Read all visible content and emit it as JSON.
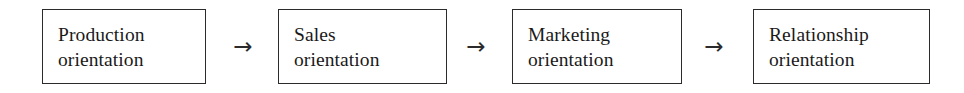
{
  "diagram": {
    "background_color": "#ffffff",
    "border_color": "#2b2b2b",
    "text_color": "#1a1a1a",
    "arrow_glyph": "→",
    "stages": [
      {
        "id": "production-orientation",
        "line1": "Production",
        "line2": "orientation",
        "x": 42,
        "y": 9,
        "width": 164,
        "height": 75
      },
      {
        "id": "sales-orientation",
        "line1": "Sales",
        "line2": "orientation",
        "x": 278,
        "y": 9,
        "width": 169,
        "height": 75
      },
      {
        "id": "marketing-orientation",
        "line1": "Marketing",
        "line2": "orientation",
        "x": 512,
        "y": 9,
        "width": 170,
        "height": 75
      },
      {
        "id": "relationship-orientation",
        "line1": "Relationship",
        "line2": "orientation",
        "x": 753,
        "y": 9,
        "width": 177,
        "height": 75
      }
    ],
    "arrows": [
      {
        "id": "arrow-production-to-sales",
        "label": "→",
        "x": 226,
        "y": 33,
        "width": 34,
        "height": 26
      },
      {
        "id": "arrow-sales-to-marketing",
        "label": "→",
        "x": 459,
        "y": 33,
        "width": 34,
        "height": 26
      },
      {
        "id": "arrow-marketing-to-relationship",
        "label": "→",
        "x": 697,
        "y": 33,
        "width": 34,
        "height": 26
      }
    ]
  }
}
